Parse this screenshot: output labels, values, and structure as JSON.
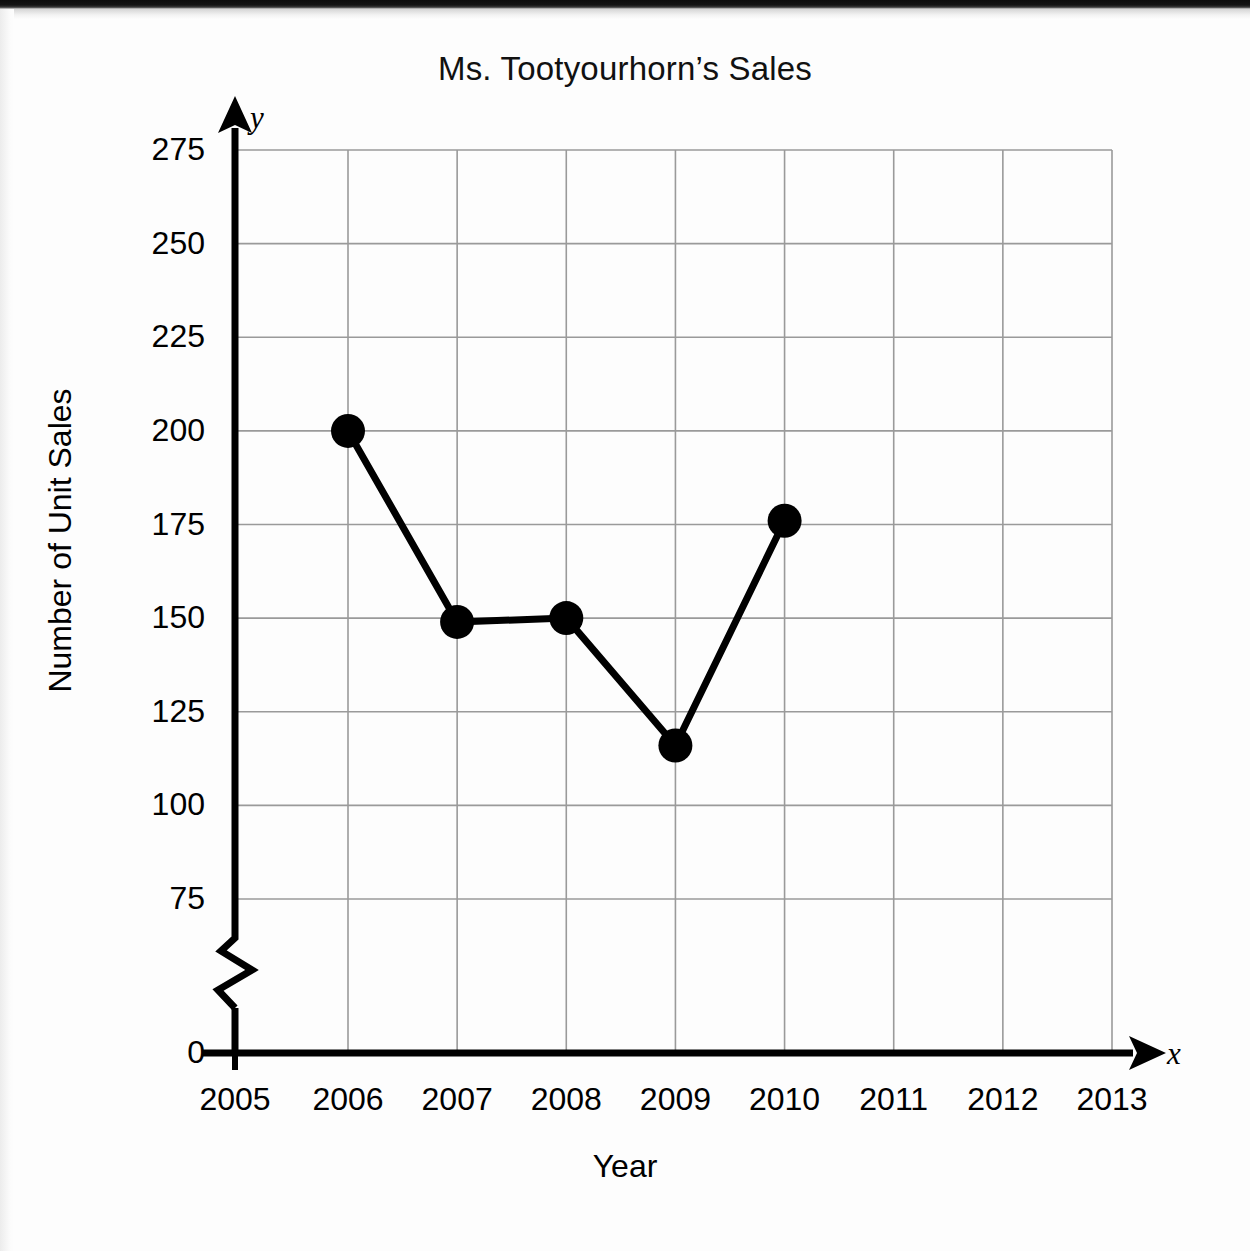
{
  "document": {
    "kind": "scanned-worksheet-figure"
  },
  "chart_data": {
    "type": "line",
    "title": "Ms. Tootyourhorn’s Sales",
    "xlabel": "Year",
    "ylabel": "Number of Unit Sales",
    "x_axis_letter": "x",
    "y_axis_letter": "y",
    "grid": true,
    "legend": null,
    "axis_break": {
      "axis": "y",
      "between": [
        0,
        75
      ],
      "symbol": "zigzag"
    },
    "categories": [
      "2005",
      "2006",
      "2007",
      "2008",
      "2009",
      "2010",
      "2011",
      "2012",
      "2013"
    ],
    "x_tick_labels": [
      "2005",
      "2006",
      "2007",
      "2008",
      "2009",
      "2010",
      "2011",
      "2012",
      "2013"
    ],
    "y_tick_labels": [
      "0",
      "75",
      "100",
      "125",
      "150",
      "175",
      "200",
      "225",
      "250",
      "275"
    ],
    "y_tick_values": [
      0,
      75,
      100,
      125,
      150,
      175,
      200,
      225,
      250,
      275
    ],
    "xlim": [
      "2005",
      "2013"
    ],
    "ylim": [
      0,
      275
    ],
    "series": [
      {
        "name": "Unit Sales",
        "color": "#000000",
        "marker": "filled-circle",
        "points": [
          {
            "x": "2006",
            "y": 200
          },
          {
            "x": "2007",
            "y": 149
          },
          {
            "x": "2008",
            "y": 150
          },
          {
            "x": "2009",
            "y": 116
          },
          {
            "x": "2010",
            "y": 176
          }
        ],
        "x": [
          "2006",
          "2007",
          "2008",
          "2009",
          "2010"
        ],
        "values": [
          200,
          149,
          150,
          116,
          176
        ]
      }
    ]
  },
  "colors": {
    "ink": "#000000",
    "gridline": "#9a9a9a",
    "paper": "#fdfdfd"
  }
}
